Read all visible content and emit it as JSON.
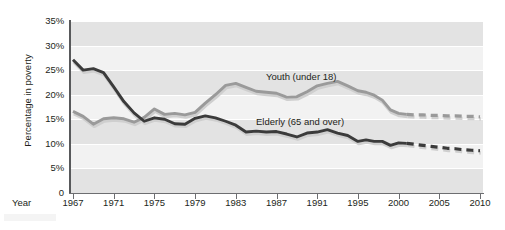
{
  "chart_data": {
    "type": "line",
    "title": "",
    "xlabel": "Year",
    "ylabel": "Percentage in poverty",
    "ylim": [
      0,
      35
    ],
    "ytick_labels": [
      "35%",
      "30%",
      "25%",
      "20%",
      "15%",
      "10%",
      "5%",
      "0"
    ],
    "ytick_values": [
      35,
      30,
      25,
      20,
      15,
      10,
      5,
      0
    ],
    "xtick_labels": [
      "1967",
      "1971",
      "1975",
      "1979",
      "1983",
      "1987",
      "1991",
      "1995",
      "2000",
      "2005",
      "2010"
    ],
    "xtick_values": [
      1967,
      1971,
      1975,
      1979,
      1983,
      1987,
      1991,
      1995,
      2000,
      2005,
      2010
    ],
    "grid": true,
    "legend_position": "inline-annotations",
    "series": [
      {
        "name": "Youth (under 18)",
        "color": "#9a9a9a",
        "style": "solid-then-dashed",
        "annotation": "Youth (under 18)",
        "x": [
          1967,
          1968,
          1969,
          1970,
          1971,
          1972,
          1973,
          1974,
          1975,
          1976,
          1977,
          1978,
          1979,
          1980,
          1981,
          1982,
          1983,
          1984,
          1985,
          1986,
          1987,
          1988,
          1989,
          1990,
          1991,
          1992,
          1993,
          1994,
          1995,
          1996,
          1997,
          1998,
          1999,
          2000,
          2001
        ],
        "values": [
          16.6,
          15.6,
          14.0,
          15.1,
          15.3,
          15.1,
          14.4,
          15.4,
          17.1,
          16.0,
          16.2,
          15.9,
          16.4,
          18.3,
          20.0,
          21.9,
          22.3,
          21.5,
          20.7,
          20.5,
          20.3,
          19.5,
          19.6,
          20.6,
          21.8,
          22.3,
          22.7,
          21.8,
          20.8,
          20.5,
          19.9,
          18.9,
          16.9,
          16.2,
          16.0
        ],
        "projection": {
          "style": "dashed",
          "x": [
            2001,
            2002,
            2003,
            2004,
            2005,
            2006,
            2007,
            2008,
            2009,
            2010
          ],
          "values": [
            16.0,
            15.9,
            15.9,
            15.8,
            15.8,
            15.7,
            15.7,
            15.6,
            15.6,
            15.5
          ]
        }
      },
      {
        "name": "Elderly (65 and over)",
        "color": "#3b3b3b",
        "style": "solid-then-dashed",
        "annotation": "Elderly (65 and over)",
        "x": [
          1967,
          1968,
          1969,
          1970,
          1971,
          1972,
          1973,
          1974,
          1975,
          1976,
          1977,
          1978,
          1979,
          1980,
          1981,
          1982,
          1983,
          1984,
          1985,
          1986,
          1987,
          1988,
          1989,
          1990,
          1991,
          1992,
          1993,
          1994,
          1995,
          1996,
          1997,
          1998,
          1999,
          2000,
          2001
        ],
        "values": [
          27.1,
          25.0,
          25.3,
          24.5,
          21.6,
          18.6,
          16.3,
          14.6,
          15.3,
          15.0,
          14.1,
          14.0,
          15.2,
          15.7,
          15.3,
          14.6,
          13.8,
          12.4,
          12.6,
          12.4,
          12.5,
          12.0,
          11.4,
          12.2,
          12.4,
          12.9,
          12.2,
          11.7,
          10.5,
          10.8,
          10.5,
          10.5,
          9.7,
          10.2,
          10.1
        ],
        "projection": {
          "style": "dashed",
          "x": [
            2001,
            2002,
            2003,
            2004,
            2005,
            2006,
            2007,
            2008,
            2009,
            2010
          ],
          "values": [
            10.1,
            9.9,
            9.7,
            9.5,
            9.3,
            9.1,
            9.0,
            8.8,
            8.7,
            8.6
          ]
        }
      }
    ]
  },
  "axis": {
    "y_title": "Percentage in poverty",
    "x_title": "Year"
  },
  "colors": {
    "plot_background": "#f2f2f2",
    "band": "#e3e3e3",
    "gridline": "#ffffff",
    "axis": "#6d6e71",
    "youth": "#9a9a9a",
    "elderly": "#3b3b3b",
    "text": "#231f20"
  }
}
